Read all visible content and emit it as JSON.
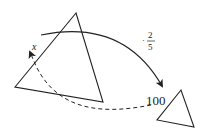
{
  "diagram": {
    "forward_arrow": {
      "label_prefix": "·",
      "fraction_numerator": "2",
      "fraction_denominator": "5"
    },
    "return_arrow": {
      "label": "x"
    },
    "small_triangle_label": "100",
    "colors": {
      "stroke": "#222222",
      "background": "#ffffff"
    }
  }
}
